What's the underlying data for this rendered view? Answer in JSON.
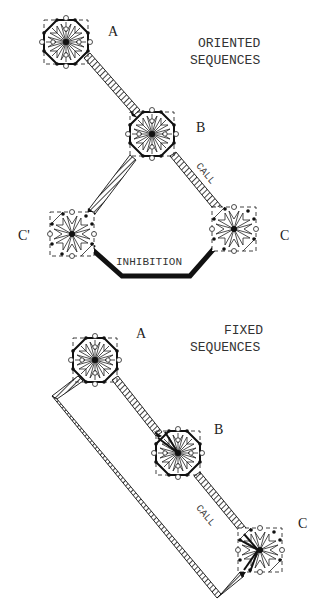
{
  "panels": [
    {
      "id": "oriented",
      "title_line1": "ORIENTED",
      "title_line2": "SEQUENCES",
      "nodes": [
        {
          "label": "A",
          "x": 66,
          "y": 42
        },
        {
          "label": "B",
          "x": 152,
          "y": 134
        },
        {
          "label": "C'",
          "x": 72,
          "y": 234
        },
        {
          "label": "C",
          "x": 234,
          "y": 229
        }
      ],
      "edges": [
        {
          "from": "A",
          "to": "B",
          "type": "hatched"
        },
        {
          "from": "B",
          "to": "C'",
          "type": "hatched"
        },
        {
          "from": "B",
          "to": "C",
          "type": "hatched",
          "label": "CALL"
        },
        {
          "from": "C",
          "to": "C'",
          "type": "bold",
          "label": "INHIBITION"
        }
      ]
    },
    {
      "id": "fixed",
      "title_line1": "FIXED",
      "title_line2": "SEQUENCES",
      "nodes": [
        {
          "label": "A",
          "x": 95,
          "y": 360
        },
        {
          "label": "B",
          "x": 178,
          "y": 453
        },
        {
          "label": "C",
          "x": 260,
          "y": 550
        }
      ],
      "edges": [
        {
          "from": "A",
          "to": "B",
          "type": "hatched"
        },
        {
          "from": "B",
          "to": "C",
          "type": "hatched",
          "label": "CALL"
        },
        {
          "from": "A",
          "to": "C",
          "type": "hatched-loop"
        }
      ]
    }
  ],
  "colors": {
    "ink": "#111111",
    "paper": "#ffffff"
  }
}
